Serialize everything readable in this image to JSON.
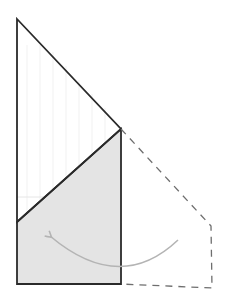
{
  "diagram": {
    "canvas": {
      "width": 230,
      "height": 301,
      "background": "#ffffff"
    },
    "colors": {
      "outline": "#2a2a2a",
      "shaded_fill": "#e4e4e4",
      "dashed": "#6e6e6e",
      "arrow": "#b4b4b4",
      "faint_lines": "#efefef"
    },
    "shapes": {
      "upper_triangle": {
        "points": [
          [
            17,
            19
          ],
          [
            121,
            129
          ],
          [
            17,
            222
          ]
        ]
      },
      "folded_flap": {
        "points": [
          [
            17,
            222
          ],
          [
            121,
            129
          ],
          [
            121,
            284
          ],
          [
            17,
            284
          ]
        ]
      },
      "original_outline_dashed": {
        "points": [
          [
            121,
            129
          ],
          [
            211,
            226
          ],
          [
            212,
            288
          ],
          [
            121,
            284
          ]
        ]
      },
      "fold_arrow": {
        "from": [
          178,
          240
        ],
        "control": [
          120,
          295
        ],
        "to": [
          50,
          236
        ]
      },
      "faint_horizontal": {
        "from": [
          17,
          197
        ],
        "to": [
          45,
          197
        ]
      }
    }
  }
}
